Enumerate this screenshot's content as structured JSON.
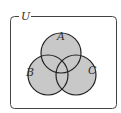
{
  "diagram": {
    "type": "venn",
    "universe_label": "U",
    "sets": [
      {
        "label": "A",
        "cx": 61,
        "cy": 53,
        "r": 20
      },
      {
        "label": "B",
        "cx": 48,
        "cy": 75,
        "r": 20
      },
      {
        "label": "C",
        "cx": 76,
        "cy": 75,
        "r": 20
      }
    ],
    "shaded_region": "A ∪ B ∪ C",
    "colors": {
      "shade": "#c8c8c8",
      "stroke": "#222222",
      "frame": "#444444",
      "background": "#ffffff"
    }
  }
}
